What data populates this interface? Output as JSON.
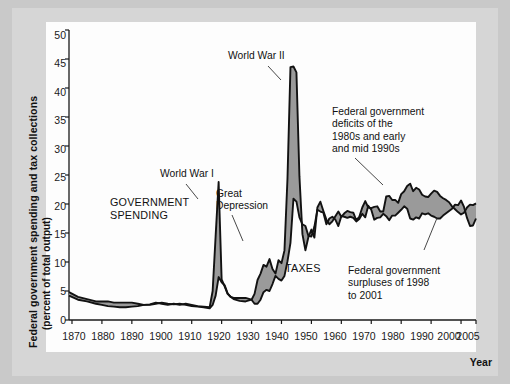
{
  "figure": {
    "axis_label_y_line1": "Federal government spending and tax collections",
    "axis_label_y_line2": "(percent of total output)",
    "axis_label_x": "Year",
    "y_ticks": [
      "0",
      "5",
      "10",
      "15",
      "20",
      "25",
      "30",
      "35",
      "40",
      "45",
      "50"
    ],
    "x_ticks": [
      "1870",
      "1880",
      "1890",
      "1900",
      "1910",
      "1920",
      "1930",
      "1940",
      "1950",
      "1960",
      "1970",
      "1980",
      "1990",
      "2000",
      "2005"
    ],
    "annotations": {
      "ww1": "World War I",
      "ww2": "World War II",
      "government_spending": "GOVERNMENT\nSPENDING",
      "great_depression": "Great\nDepression",
      "taxes": "TAXES",
      "deficits": "Federal government\ndeficits of the\n1980s and early\nand mid 1990s",
      "surpluses": "Federal government\nsurpluses of 1998\nto 2001"
    },
    "colors": {
      "line": "#121212",
      "fill": "#9a9a9a",
      "plot_background": "#fdfdfd",
      "page_background": "#d6d6d6",
      "border": "#c9c9c9"
    }
  },
  "chart_data": {
    "type": "line",
    "title": "",
    "xlabel": "Year",
    "ylabel": "Federal government spending and tax collections (percent of total output)",
    "xlim": [
      1869,
      2005
    ],
    "ylim": [
      0,
      50
    ],
    "grid": false,
    "legend": "inline annotations",
    "x": [
      1869,
      1872,
      1875,
      1878,
      1880,
      1882,
      1884,
      1886,
      1888,
      1890,
      1892,
      1894,
      1896,
      1898,
      1900,
      1902,
      1904,
      1906,
      1908,
      1910,
      1912,
      1914,
      1916,
      1917,
      1918,
      1919,
      1920,
      1921,
      1922,
      1923,
      1924,
      1926,
      1928,
      1930,
      1931,
      1932,
      1933,
      1934,
      1935,
      1936,
      1937,
      1938,
      1939,
      1940,
      1941,
      1942,
      1943,
      1944,
      1945,
      1946,
      1947,
      1948,
      1949,
      1950,
      1951,
      1952,
      1953,
      1954,
      1955,
      1956,
      1957,
      1958,
      1959,
      1960,
      1961,
      1962,
      1963,
      1964,
      1965,
      1966,
      1967,
      1968,
      1969,
      1970,
      1971,
      1972,
      1973,
      1974,
      1975,
      1976,
      1977,
      1978,
      1979,
      1980,
      1981,
      1982,
      1983,
      1984,
      1985,
      1986,
      1987,
      1988,
      1989,
      1990,
      1991,
      1992,
      1993,
      1994,
      1995,
      1996,
      1997,
      1998,
      1999,
      2000,
      2001,
      2002,
      2003,
      2004,
      2005
    ],
    "series": [
      {
        "name": "Government spending",
        "values": [
          4.2,
          3.5,
          3.2,
          2.8,
          2.6,
          2.4,
          2.3,
          2.2,
          2.2,
          2.3,
          2.4,
          2.6,
          2.7,
          3.0,
          2.8,
          2.6,
          2.8,
          2.6,
          2.8,
          2.6,
          2.4,
          2.3,
          2.2,
          5.0,
          14.5,
          23.8,
          7.0,
          5.8,
          4.5,
          4.0,
          3.6,
          3.3,
          3.2,
          3.5,
          4.5,
          6.9,
          8.0,
          9.5,
          9.2,
          10.5,
          8.8,
          8.0,
          10.3,
          9.8,
          12.0,
          24.3,
          43.6,
          43.7,
          42.7,
          24.8,
          14.8,
          12.0,
          14.3,
          15.6,
          14.2,
          19.4,
          20.4,
          18.8,
          17.3,
          16.5,
          17.0,
          17.9,
          18.7,
          17.8,
          18.4,
          18.8,
          18.6,
          18.5,
          17.2,
          17.8,
          19.4,
          20.5,
          19.4,
          19.3,
          19.5,
          19.6,
          18.7,
          18.7,
          21.3,
          21.4,
          20.7,
          20.7,
          20.2,
          21.7,
          22.2,
          23.1,
          23.5,
          22.2,
          22.8,
          22.5,
          21.6,
          21.3,
          21.2,
          21.8,
          22.3,
          22.1,
          21.4,
          21.0,
          20.7,
          20.3,
          19.6,
          19.1,
          18.6,
          18.2,
          18.5,
          19.4,
          19.9,
          19.8,
          20.1
        ]
      },
      {
        "name": "Tax collections",
        "values": [
          4.8,
          4.0,
          3.6,
          3.2,
          3.2,
          3.2,
          3.0,
          3.0,
          3.0,
          3.0,
          2.8,
          2.6,
          2.6,
          2.8,
          3.0,
          2.8,
          2.7,
          2.8,
          2.6,
          2.4,
          2.3,
          2.2,
          2.0,
          2.6,
          4.2,
          7.4,
          6.5,
          6.0,
          4.6,
          4.0,
          3.8,
          3.8,
          3.8,
          3.5,
          2.8,
          2.8,
          3.5,
          4.8,
          5.2,
          5.0,
          6.2,
          7.6,
          7.1,
          6.8,
          7.6,
          10.1,
          13.3,
          20.9,
          20.4,
          17.7,
          16.5,
          16.2,
          14.5,
          14.4,
          16.1,
          19.0,
          18.7,
          18.5,
          16.5,
          17.5,
          17.8,
          17.3,
          16.2,
          17.9,
          17.8,
          17.6,
          17.8,
          17.6,
          17.0,
          17.4,
          18.3,
          17.7,
          19.7,
          19.0,
          17.3,
          17.6,
          17.7,
          18.3,
          17.9,
          17.2,
          18.0,
          18.0,
          18.5,
          19.0,
          19.6,
          19.2,
          17.5,
          17.3,
          17.7,
          17.5,
          18.4,
          18.2,
          18.4,
          18.0,
          17.8,
          17.5,
          17.5,
          18.0,
          18.4,
          18.8,
          19.2,
          19.9,
          19.8,
          20.6,
          19.5,
          17.6,
          16.2,
          16.3,
          17.5
        ]
      }
    ],
    "shaded_band": "area between spending and tax collections"
  }
}
